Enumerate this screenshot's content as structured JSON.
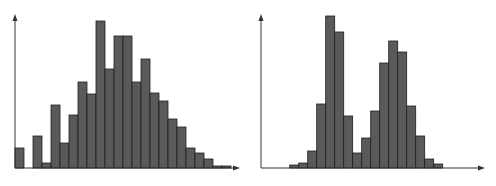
{
  "colors": {
    "bar_fill": "#5a5a5a",
    "bar_stroke": "#1e1e1e",
    "axis": "#333333",
    "background": "#ffffff"
  },
  "chart_data": [
    {
      "type": "bar",
      "title": "",
      "xlabel": "",
      "ylabel": "",
      "description": "Unimodal right-skewed histogram",
      "grid": false,
      "legend": null,
      "categories": [
        "1",
        "2",
        "3",
        "4",
        "5",
        "6",
        "7",
        "8",
        "9",
        "10",
        "11",
        "12",
        "13",
        "14",
        "15",
        "16",
        "17",
        "18",
        "19",
        "20",
        "21",
        "22",
        "23",
        "24"
      ],
      "values": [
        20,
        0,
        32,
        5,
        63,
        25,
        53,
        86,
        74,
        147,
        99,
        132,
        132,
        86,
        109,
        75,
        67,
        49,
        41,
        20,
        15,
        9,
        2,
        2
      ],
      "ylim": [
        0,
        154
      ]
    },
    {
      "type": "bar",
      "title": "",
      "xlabel": "",
      "ylabel": "",
      "description": "Bimodal histogram",
      "grid": false,
      "legend": null,
      "categories": [
        "1",
        "2",
        "3",
        "4",
        "5",
        "6",
        "7",
        "8",
        "9",
        "10",
        "11",
        "12",
        "13",
        "14",
        "15",
        "16",
        "17"
      ],
      "values": [
        3,
        5,
        17,
        64,
        152,
        136,
        52,
        15,
        30,
        57,
        105,
        127,
        116,
        62,
        32,
        9,
        4
      ],
      "ylim": [
        0,
        154
      ]
    }
  ],
  "layout": {
    "left": {
      "axis_x": 15,
      "baseline": 168,
      "axis_top": 14,
      "axis_right": 240,
      "bar_x0": 15,
      "bar_w": 9
    },
    "right": {
      "axis_x": 13,
      "baseline": 168,
      "axis_top": 14,
      "axis_right": 237,
      "bar_x0": 41.7,
      "bar_w": 9
    }
  }
}
